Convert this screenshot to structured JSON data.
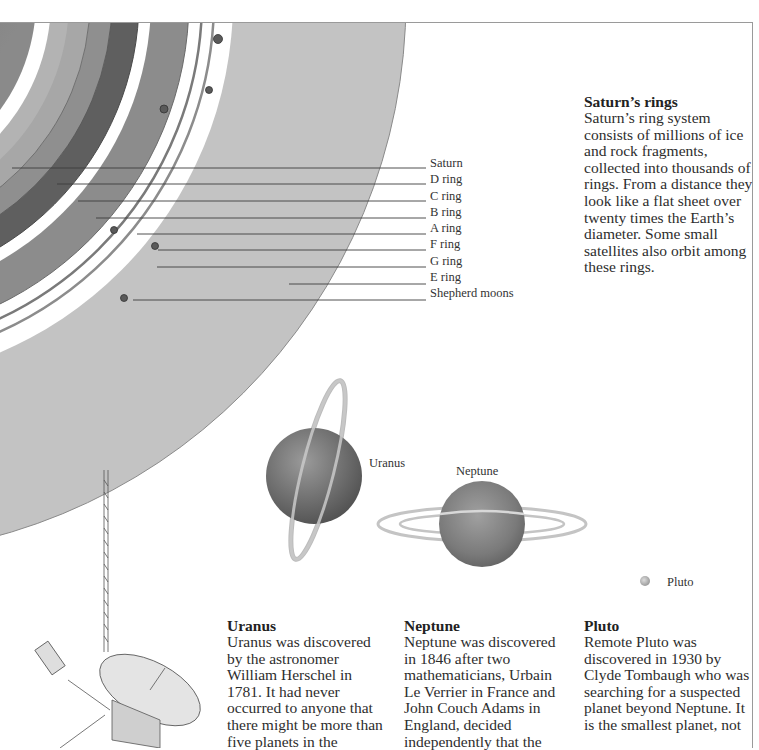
{
  "illustration": {
    "title": "Outer planets",
    "saturn_ring_labels": [
      {
        "label": "Saturn",
        "line_y": 168,
        "line_x_start": 12
      },
      {
        "label": "D ring",
        "line_y": 184,
        "line_x_start": 57
      },
      {
        "label": "C ring",
        "line_y": 201,
        "line_x_start": 78
      },
      {
        "label": "B ring",
        "line_y": 218,
        "line_x_start": 96
      },
      {
        "label": "A ring",
        "line_y": 234,
        "line_x_start": 137
      },
      {
        "label": "F ring",
        "line_y": 250,
        "line_x_start": 158
      },
      {
        "label": "G ring",
        "line_y": 267,
        "line_x_start": 157
      },
      {
        "label": "E ring",
        "line_y": 284,
        "line_x_start": 289
      },
      {
        "label": "Shepherd moons",
        "line_y": 300,
        "line_x_start": 133
      }
    ],
    "planet_labels": {
      "uranus": "Uranus",
      "neptune": "Neptune",
      "pluto": "Pluto"
    },
    "colors": {
      "e_ring": "#c3c3c3",
      "a_ring": "#8e8e8e",
      "b_ring": "#5e5e5e",
      "c_ring": "#a9a9a9",
      "saturn_body": "#7a7a7a",
      "gap": "#ffffff",
      "planet_uranus": "#6f6f6f",
      "planet_neptune": "#7d7d7d",
      "pluto": "#b8b8b8",
      "frame_line": "#9a9a9a"
    }
  },
  "sections": {
    "saturn_rings": {
      "heading": "Saturn’s rings",
      "body": "Saturn’s ring system consists of millions of ice and rock fragments, collected into thousands of rings. From a distance they look like a flat sheet over twenty times the Earth’s diameter. Some small satellites also orbit among these rings."
    },
    "uranus": {
      "heading": "Uranus",
      "body": "Uranus was discovered by the astronomer William Herschel in 1781. It had never occurred to anyone that there might be more than five planets in the"
    },
    "neptune": {
      "heading": "Neptune",
      "body": "Neptune was discovered in 1846 after two mathematicians, Urbain Le Verrier in France and John Couch Adams in England, decided independently that the"
    },
    "pluto": {
      "heading": "Pluto",
      "body": "Remote Pluto was discovered in 1930 by Clyde Tombaugh who was searching for a suspected planet beyond Neptune. It is the smallest planet, not"
    }
  }
}
